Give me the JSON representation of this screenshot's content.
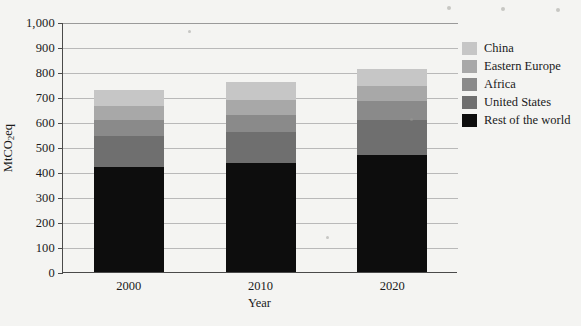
{
  "chart_data": {
    "type": "bar",
    "stacked": true,
    "title": "",
    "xlabel": "Year",
    "ylabel": "MtCO2eq",
    "ylabel_parts": {
      "pre": "MtCO",
      "sub": "2",
      "post": "eq"
    },
    "categories": [
      "2000",
      "2010",
      "2020"
    ],
    "ylim": [
      0,
      1000
    ],
    "ytick_step": 100,
    "ytick_labels": [
      "0",
      "100",
      "200",
      "300",
      "400",
      "500",
      "600",
      "700",
      "800",
      "900",
      "1,000"
    ],
    "grid": true,
    "grid_axis": "y",
    "legend_position": "right",
    "series": [
      {
        "name": "Rest of the world",
        "color": "#0d0d0d",
        "values": [
          420,
          435,
          470
        ]
      },
      {
        "name": "United States",
        "color": "#6f6f6f",
        "values": [
          125,
          125,
          140
        ]
      },
      {
        "name": "Africa",
        "color": "#8a8a8a",
        "values": [
          65,
          70,
          75
        ]
      },
      {
        "name": "Eastern Europe",
        "color": "#a8a8a8",
        "values": [
          55,
          60,
          60
        ]
      },
      {
        "name": "China",
        "color": "#c6c6c6",
        "values": [
          63,
          72,
          67
        ]
      }
    ],
    "totals": [
      728,
      762,
      812
    ],
    "legend_entries": [
      {
        "label": "China",
        "color": "#c6c6c6"
      },
      {
        "label": "Eastern Europe",
        "color": "#a8a8a8"
      },
      {
        "label": "Africa",
        "color": "#8a8a8a"
      },
      {
        "label": "United States",
        "color": "#6f6f6f"
      },
      {
        "label": "Rest of the world",
        "color": "#0d0d0d"
      }
    ]
  },
  "colors": {
    "page_background": "#f4f4f2",
    "axis": "#4a4a4a",
    "gridline": "#b9b9b9",
    "text": "#1a1a1a"
  }
}
